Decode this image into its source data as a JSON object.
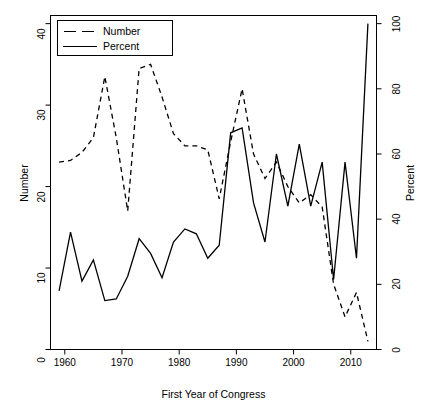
{
  "chart_data": {
    "type": "line",
    "title": "",
    "xlabel": "First Year of Congress",
    "ylabel": "Number",
    "y2label": "Percent",
    "xlim": [
      1957.5,
      2014.5
    ],
    "ylim": [
      0,
      41
    ],
    "y2lim": [
      0,
      102.5
    ],
    "grid": false,
    "legend_position": "top-left",
    "xticks": [
      1960,
      1970,
      1980,
      1990,
      2000,
      2010
    ],
    "yticks": [
      0,
      10,
      20,
      30,
      40
    ],
    "y2ticks": [
      0,
      20,
      40,
      60,
      80,
      100
    ],
    "x": [
      1959,
      1961,
      1963,
      1965,
      1967,
      1969,
      1971,
      1973,
      1975,
      1977,
      1979,
      1981,
      1983,
      1985,
      1987,
      1989,
      1991,
      1993,
      1995,
      1997,
      1999,
      2001,
      2003,
      2005,
      2007,
      2009,
      2011,
      2013
    ],
    "series": [
      {
        "name": "Number",
        "axis": "left",
        "style": "dashed",
        "color": "#000000",
        "values": [
          23.0,
          23.2,
          24.2,
          26.0,
          33.5,
          26.0,
          17.0,
          34.5,
          35.0,
          31.0,
          26.5,
          25.0,
          25.0,
          24.5,
          18.5,
          25.5,
          32.0,
          24.0,
          21.0,
          23.0,
          20.0,
          18.0,
          19.0,
          17.5,
          8.0,
          4.0,
          7.0,
          1.0
        ]
      },
      {
        "name": "Percent",
        "axis": "right",
        "style": "solid",
        "color": "#000000",
        "values": [
          18.0,
          36.0,
          21.0,
          27.5,
          15.0,
          15.5,
          22.5,
          34.0,
          29.5,
          22.0,
          33.0,
          37.0,
          35.5,
          28.0,
          32.0,
          66.5,
          68.0,
          45.0,
          33.0,
          60.0,
          44.0,
          63.0,
          44.0,
          57.5,
          21.5,
          57.5,
          28.0,
          100.0
        ]
      }
    ],
    "legend": [
      {
        "label": "Number",
        "style": "dashed"
      },
      {
        "label": "Percent",
        "style": "solid"
      }
    ]
  },
  "axes": {
    "left_title": "Number",
    "right_title": "Percent",
    "bottom_title": "First Year of Congress"
  }
}
